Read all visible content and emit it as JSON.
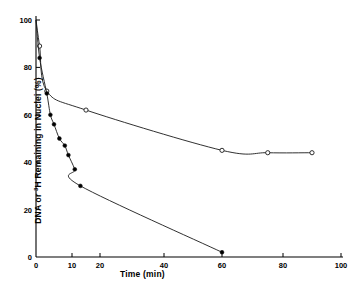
{
  "chart_data": {
    "type": "line",
    "title": "",
    "xlabel": "Time (min)",
    "ylabel_prefix": "DNA or ",
    "ylabel_sup": "3",
    "ylabel_suffix": "H Remaining in Nuclei  (%)",
    "ylabel_plain": "DNA or 3H Remaining in Nuclei (%)",
    "xlim": [
      0,
      100
    ],
    "ylim": [
      0,
      100
    ],
    "x_ticks": [
      0,
      10,
      20,
      40,
      60,
      80,
      100
    ],
    "y_ticks": [
      0,
      20,
      40,
      60,
      80,
      100
    ],
    "x_scale_note": "non-linear: 0-20 compressed relative to 20-100",
    "grid": false,
    "legend": "none",
    "series": [
      {
        "name": "DNA remaining in nuclei",
        "marker": "open-circle",
        "points": [
          {
            "x": 0,
            "y": 100
          },
          {
            "x": 1,
            "y": 89
          },
          {
            "x": 3,
            "y": 70
          },
          {
            "x": 15,
            "y": 62
          },
          {
            "x": 60,
            "y": 45
          },
          {
            "x": 75,
            "y": 44
          },
          {
            "x": 90,
            "y": 44
          }
        ]
      },
      {
        "name": "3H remaining in nuclei",
        "marker": "filled-circle",
        "points": [
          {
            "x": 0,
            "y": 100
          },
          {
            "x": 1,
            "y": 84
          },
          {
            "x": 3,
            "y": 69
          },
          {
            "x": 4,
            "y": 60
          },
          {
            "x": 5,
            "y": 56
          },
          {
            "x": 6.5,
            "y": 50
          },
          {
            "x": 8,
            "y": 47
          },
          {
            "x": 9,
            "y": 43
          },
          {
            "x": 11,
            "y": 37
          },
          {
            "x": 13,
            "y": 30
          },
          {
            "x": 60,
            "y": 2
          }
        ]
      }
    ],
    "colors": {
      "axis": "#000000",
      "curve": "#1a1a1a",
      "marker_fill": "#000000",
      "marker_open_fill": "#ffffff",
      "background": "#ffffff"
    }
  }
}
